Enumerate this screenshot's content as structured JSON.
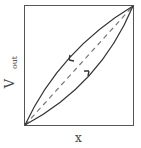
{
  "figure": {
    "type": "hysteresis-loop",
    "x_axis_label": "x",
    "y_axis_label_main": "V",
    "y_axis_label_sub": "out",
    "curves": [
      {
        "name": "upper-branch",
        "direction": "decreasing",
        "arrow": "down-left"
      },
      {
        "name": "lower-branch",
        "direction": "increasing",
        "arrow": "up-right"
      },
      {
        "name": "linear-reference",
        "style": "dashed"
      }
    ],
    "colors": {
      "line": "#333333",
      "dashed": "#777777",
      "frame": "#555555"
    }
  }
}
